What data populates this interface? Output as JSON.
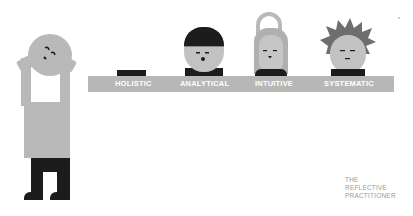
{
  "scene": {
    "description": "Illustration of four character types standing behind a bar, and a figure holding his head",
    "colors": {
      "background": "#ffffff",
      "figure_grey": "#b9b9b9",
      "bar_grey": "#b7b7b7",
      "dark": "#1c1c1c",
      "hair_grey": "#6e6e6e",
      "label_text": "#ffffff",
      "caption_text": "#9a9a9a"
    }
  },
  "bar": {
    "labels": [
      "HOLISTIC",
      "ANALYTICAL",
      "INTUITIVE",
      "SYSTEMATIC"
    ]
  },
  "caption": {
    "lines": [
      "THE",
      "REFLECTIVE",
      "PRACTITIONER"
    ]
  }
}
